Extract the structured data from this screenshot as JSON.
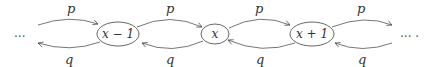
{
  "diagram": {
    "type": "birth-death chain / random walk",
    "left_ellipsis": "...",
    "right_ellipsis": "... .",
    "nodes": [
      {
        "id": "n_xm1",
        "label": "x − 1"
      },
      {
        "id": "n_x",
        "label": "x"
      },
      {
        "id": "n_xp1",
        "label": "x + 1"
      }
    ],
    "edges": [
      {
        "from": "left",
        "to": "x − 1",
        "label": "p",
        "direction": "forward"
      },
      {
        "from": "x − 1",
        "to": "left",
        "label": "q",
        "direction": "backward"
      },
      {
        "from": "x − 1",
        "to": "x",
        "label": "p",
        "direction": "forward"
      },
      {
        "from": "x",
        "to": "x − 1",
        "label": "q",
        "direction": "backward"
      },
      {
        "from": "x",
        "to": "x + 1",
        "label": "p",
        "direction": "forward"
      },
      {
        "from": "x + 1",
        "to": "x",
        "label": "q",
        "direction": "backward"
      },
      {
        "from": "x + 1",
        "to": "right",
        "label": "p",
        "direction": "forward"
      },
      {
        "from": "right",
        "to": "x + 1",
        "label": "q",
        "direction": "backward"
      }
    ],
    "colors": {
      "stroke": "#555555",
      "text": "#333333",
      "background": "#ffffff"
    }
  }
}
